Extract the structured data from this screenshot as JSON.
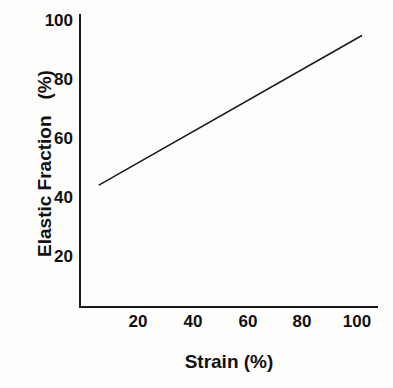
{
  "figure": {
    "width": 393,
    "height": 388,
    "background_color": "#fdfdfc",
    "ink_color": "#1a1a1a"
  },
  "chart_data": {
    "type": "line",
    "title": "",
    "subtitle": "",
    "xlabel": "Strain (%)",
    "ylabel": "Elastic Fraction   (%)",
    "xlim": [
      0,
      108
    ],
    "ylim": [
      0,
      108
    ],
    "xticks": [
      20,
      40,
      60,
      80,
      100
    ],
    "yticks": [
      20,
      40,
      60,
      80,
      100
    ],
    "xticklabels": [
      "20",
      "40",
      "60",
      "80",
      "100"
    ],
    "yticklabels": [
      "20",
      "40",
      "60",
      "80",
      "100"
    ],
    "grid": false,
    "tick_marks": false,
    "legend": null,
    "legend_position": "none",
    "annotations": [],
    "series": [
      {
        "name": "elastic fraction vs strain",
        "color": "#1a1a1a",
        "linewidth": 1.6,
        "style": "solid",
        "marker": "none",
        "x": [
          7,
          102
        ],
        "y": [
          45,
          100
        ]
      }
    ]
  }
}
